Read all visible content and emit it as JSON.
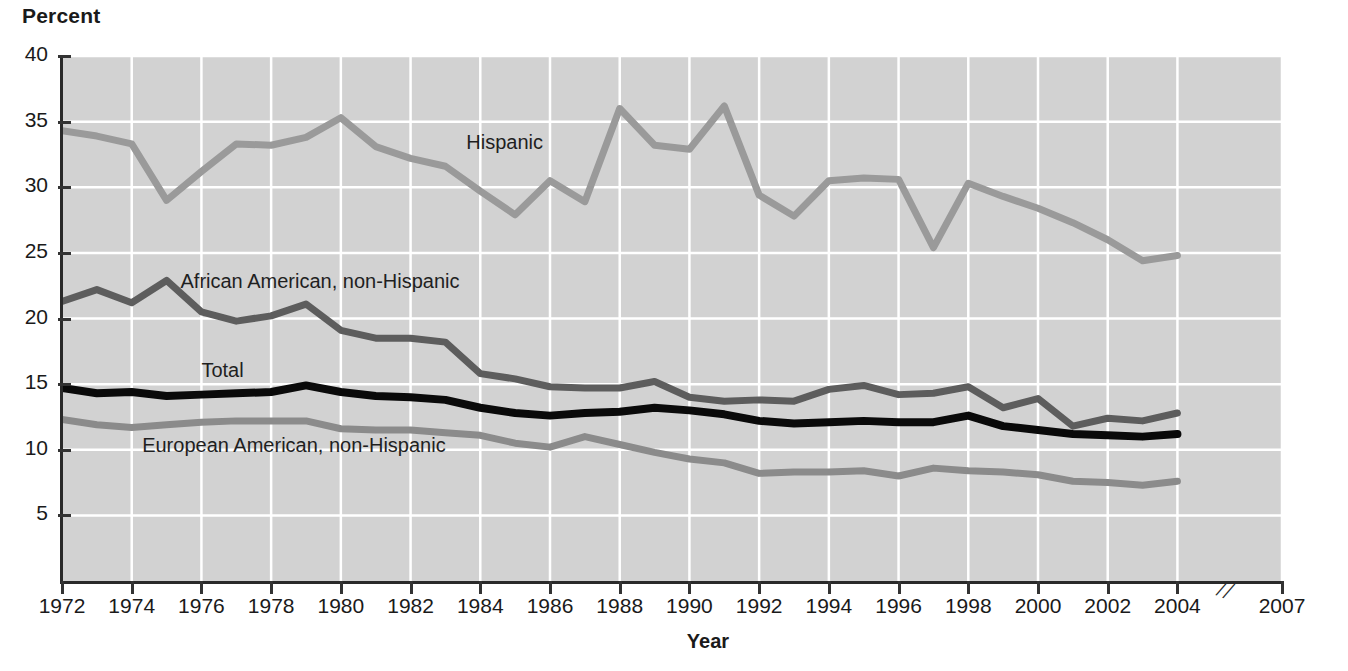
{
  "chart_data": {
    "type": "line",
    "title": "",
    "xlabel": "Year",
    "ylabel": "Percent",
    "xlim": [
      1972,
      2007
    ],
    "ylim": [
      0,
      40
    ],
    "grid": true,
    "legend_position": "inline-labels",
    "axis_break": {
      "between": [
        2004,
        2007
      ],
      "symbol": "//"
    },
    "ytick_labels": [
      "40",
      "35",
      "30",
      "25",
      "20",
      "15",
      "10",
      "5"
    ],
    "ytick_values": [
      40,
      35,
      30,
      25,
      20,
      15,
      10,
      5
    ],
    "xtick_labels": [
      "1972",
      "1974",
      "1976",
      "1978",
      "1980",
      "1982",
      "1984",
      "1986",
      "1988",
      "1990",
      "1992",
      "1994",
      "1996",
      "1998",
      "2000",
      "2002",
      "2004",
      "2007"
    ],
    "xtick_values": [
      1972,
      1974,
      1976,
      1978,
      1980,
      1982,
      1984,
      1986,
      1988,
      1990,
      1992,
      1994,
      1996,
      1998,
      2000,
      2002,
      2004,
      2007
    ],
    "x": [
      1972,
      1973,
      1974,
      1975,
      1976,
      1977,
      1978,
      1979,
      1980,
      1981,
      1982,
      1983,
      1984,
      1985,
      1986,
      1987,
      1988,
      1989,
      1990,
      1991,
      1992,
      1993,
      1994,
      1995,
      1996,
      1997,
      1998,
      1999,
      2000,
      2001,
      2002,
      2003,
      2004
    ],
    "series": [
      {
        "name": "Hispanic",
        "color": "#9a9a9a",
        "values": [
          34.3,
          33.9,
          33.3,
          29.0,
          31.2,
          33.3,
          33.2,
          33.8,
          35.3,
          33.1,
          32.2,
          31.6,
          29.7,
          27.9,
          30.5,
          28.9,
          36.0,
          33.2,
          32.9,
          36.2,
          29.4,
          27.8,
          30.5,
          30.7,
          30.6,
          25.4,
          30.3,
          29.3,
          28.4,
          27.3,
          26.0,
          24.4,
          24.8
        ]
      },
      {
        "name": "African American, non-Hispanic",
        "color": "#5d5d5d",
        "values": [
          21.3,
          22.2,
          21.2,
          22.9,
          20.5,
          19.8,
          20.2,
          21.1,
          19.1,
          18.5,
          18.5,
          18.2,
          15.8,
          15.4,
          14.8,
          14.7,
          14.7,
          15.2,
          14.0,
          13.7,
          13.8,
          13.7,
          14.6,
          14.9,
          14.2,
          14.3,
          14.8,
          13.2,
          13.9,
          11.8,
          12.4,
          12.2,
          12.8
        ]
      },
      {
        "name": "Total",
        "color": "#0a0a0a",
        "values": [
          14.7,
          14.3,
          14.4,
          14.1,
          14.2,
          14.3,
          14.4,
          14.9,
          14.4,
          14.1,
          14.0,
          13.8,
          13.2,
          12.8,
          12.6,
          12.8,
          12.9,
          13.2,
          13.0,
          12.7,
          12.2,
          12.0,
          12.1,
          12.2,
          12.1,
          12.1,
          12.6,
          11.8,
          11.5,
          11.2,
          11.1,
          11.0,
          11.2
        ]
      },
      {
        "name": "European American, non-Hispanic",
        "color": "#8b8b8b",
        "values": [
          12.3,
          11.9,
          11.7,
          11.9,
          12.1,
          12.2,
          12.2,
          12.2,
          11.6,
          11.5,
          11.5,
          11.3,
          11.1,
          10.5,
          10.2,
          11.0,
          10.4,
          9.8,
          9.3,
          9.0,
          8.2,
          8.3,
          8.3,
          8.4,
          8.0,
          8.6,
          8.4,
          8.3,
          8.1,
          7.6,
          7.5,
          7.3,
          7.6
        ]
      }
    ],
    "series_label_positions": [
      {
        "name": "Hispanic",
        "x": 1983.6,
        "y": 33.3
      },
      {
        "name": "African American, non-Hispanic",
        "x": 1975.4,
        "y": 22.7
      },
      {
        "name": "Total",
        "x": 1976.0,
        "y": 15.9
      },
      {
        "name": "European American, non-Hispanic",
        "x": 1974.3,
        "y": 10.2
      }
    ]
  },
  "axes": {
    "y_title": "Percent",
    "x_title": "Year"
  },
  "colors": {
    "plot_background": "#d2d2d2",
    "gridline": "#ffffff",
    "axis": "#2a2a2a",
    "hispanic": "#9a9a9a",
    "african_american": "#5d5d5d",
    "total": "#0a0a0a",
    "european_american": "#8b8b8b"
  }
}
